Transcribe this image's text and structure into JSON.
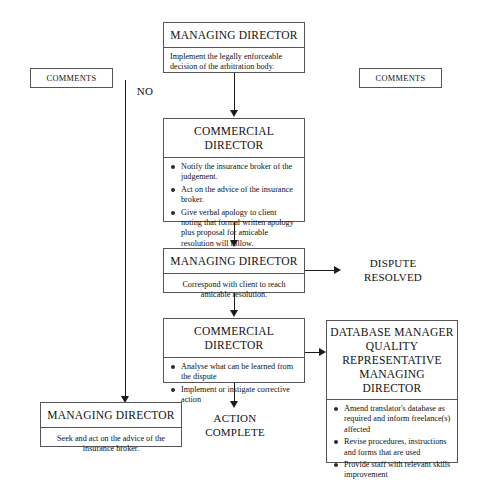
{
  "diagram": {
    "line_color": "#1b1b1b",
    "box_border_color": "#555555",
    "background": "#ffffff"
  },
  "nodes": {
    "top_managing_director": {
      "title": "MANAGING DIRECTOR",
      "body": "Implement  the legally enforceable decision of the arbitration body."
    },
    "commercial_director_1": {
      "title": "COMMERCIAL DIRECTOR",
      "bullets": [
        "Notify the insurance broker of the judgement.",
        "Act on the advice of the insurance broker.",
        "Give verbal apology to client noting that formal written apology plus proposal for amicable resolution will follow."
      ]
    },
    "managing_director_2": {
      "title": "MANAGING DIRECTOR",
      "body": "Correspond with client to reach amicable resolution."
    },
    "commercial_director_2": {
      "title": "COMMERCIAL DIRECTOR",
      "bullets": [
        "Analyse what can be learned from the dispute",
        "Implement or instigate corrective action"
      ]
    },
    "database_manager": {
      "title": "DATABASE MANAGER\nQUALITY\nREPRESENTATIVE\nMANAGING DIRECTOR",
      "bullets": [
        "Amend  translator's database as required and inform freelance(s) affected",
        "Revise procedures, instructions and forms that are used",
        "Provide staff with relevant skills improvement"
      ]
    },
    "managing_director_bottom": {
      "title": "MANAGING DIRECTOR",
      "body": "Seek and act on the advice of the insurance broker."
    }
  },
  "tags": {
    "comments_left": "COMMENTS",
    "comments_right": "COMMENTS"
  },
  "labels": {
    "no_branch": "NO",
    "dispute_resolved": "DISPUTE\nRESOLVED",
    "action_complete": "ACTION\nCOMPLETE"
  }
}
